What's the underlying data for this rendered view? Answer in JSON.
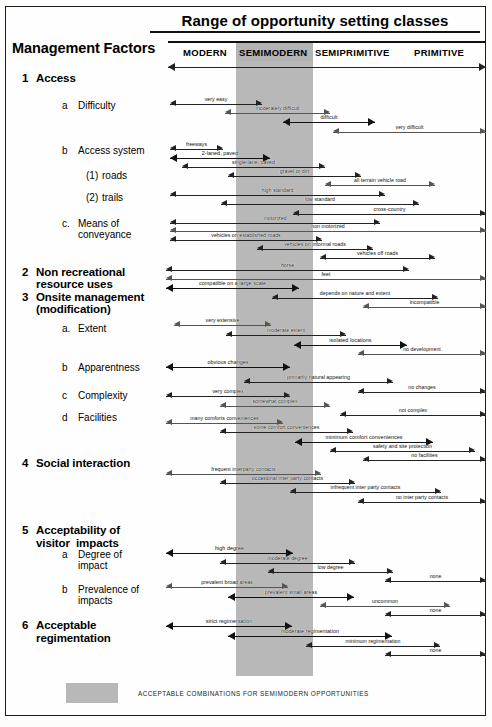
{
  "title": "Range of opportunity setting classes",
  "header": {
    "row_label": "Management Factors",
    "columns": [
      {
        "label": "MODERN",
        "x": 183,
        "shaded": false
      },
      {
        "label": "SEMIMODERN",
        "x": 239,
        "shaded": true
      },
      {
        "label": "SEMIPRIMITIVE",
        "x": 315,
        "shaded": false
      },
      {
        "label": "PRIMITIVE",
        "x": 414,
        "shaded": false
      }
    ]
  },
  "shaded_band": {
    "color": "#b8b8b8",
    "left": 236,
    "width": 77,
    "top": 43,
    "bottom": 676
  },
  "legend": {
    "swatch_color": "#b8b8b8",
    "text": "ACCEPTABLE COMBINATIONS FOR SEMIMODERN OPPORTUNITIES"
  },
  "factors": [
    {
      "num": "1",
      "label": "Access",
      "level": 1,
      "x": 22,
      "y": 72
    },
    {
      "num": "a",
      "label": "Difficulty",
      "level": 2,
      "x": 62,
      "y": 100
    },
    {
      "num": "b",
      "label": "Access system",
      "level": 2,
      "x": 62,
      "y": 145
    },
    {
      "num": "(1)",
      "label": "roads",
      "level": 3,
      "x": 86,
      "y": 170
    },
    {
      "num": "(2)",
      "label": "trails",
      "level": 3,
      "x": 86,
      "y": 192
    },
    {
      "num": "c.",
      "label": "Means of",
      "level": 2,
      "x": 62,
      "y": 218
    },
    {
      "num": "",
      "label": "conveyance",
      "level": 2,
      "x": 78,
      "y": 229
    },
    {
      "num": "2",
      "label": "Non recreational",
      "level": 1,
      "x": 22,
      "y": 266
    },
    {
      "num": "",
      "label": "resource uses",
      "level": 1,
      "x": 36,
      "y": 278
    },
    {
      "num": "3",
      "label": "Onsite management",
      "level": 1,
      "x": 22,
      "y": 291
    },
    {
      "num": "",
      "label": "(modification)",
      "level": 1,
      "x": 36,
      "y": 303
    },
    {
      "num": "a.",
      "label": "Extent",
      "level": 2,
      "x": 62,
      "y": 323
    },
    {
      "num": "b",
      "label": "Apparentness",
      "level": 2,
      "x": 62,
      "y": 362
    },
    {
      "num": "c",
      "label": "Complexity",
      "level": 2,
      "x": 62,
      "y": 390
    },
    {
      "num": "d",
      "label": "Facilities",
      "level": 2,
      "x": 62,
      "y": 412
    },
    {
      "num": "4",
      "label": "Social interaction",
      "level": 1,
      "x": 22,
      "y": 457
    },
    {
      "num": "5",
      "label": "Acceptability of",
      "level": 1,
      "x": 22,
      "y": 524
    },
    {
      "num": "",
      "label": "visitor  impacts",
      "level": 1,
      "x": 36,
      "y": 537
    },
    {
      "num": "a",
      "label": "Degree of",
      "level": 2,
      "x": 62,
      "y": 549
    },
    {
      "num": "",
      "label": "impact",
      "level": 2,
      "x": 78,
      "y": 560
    },
    {
      "num": "b",
      "label": "Prevalence of",
      "level": 2,
      "x": 62,
      "y": 584
    },
    {
      "num": "",
      "label": "impacts",
      "level": 2,
      "x": 78,
      "y": 595
    },
    {
      "num": "6",
      "label": "Acceptable",
      "level": 1,
      "x": 22,
      "y": 619
    },
    {
      "num": "",
      "label": "regimentation",
      "level": 1,
      "x": 36,
      "y": 632
    }
  ],
  "arrows": [
    {
      "label": "very easy",
      "x": 170,
      "w": 92,
      "y": 99,
      "weight": "normal"
    },
    {
      "label": "moderately difficult",
      "x": 225,
      "w": 105,
      "y": 108,
      "weight": "light"
    },
    {
      "label": "difficult",
      "x": 283,
      "w": 92,
      "y": 117,
      "weight": "bold"
    },
    {
      "label": "very difficult",
      "x": 333,
      "w": 153,
      "y": 127,
      "weight": "light"
    },
    {
      "label": "freeways",
      "x": 170,
      "w": 53,
      "y": 144,
      "weight": "normal"
    },
    {
      "label": "2-laned, paved",
      "x": 170,
      "w": 100,
      "y": 153,
      "weight": "bold"
    },
    {
      "label": "single-lane, paved",
      "x": 182,
      "w": 143,
      "y": 162,
      "weight": "normal"
    },
    {
      "label": "gravel or dirt",
      "x": 228,
      "w": 133,
      "y": 171,
      "weight": "normal"
    },
    {
      "label": "all terrain vehicle road",
      "x": 325,
      "w": 110,
      "y": 180,
      "weight": "light"
    },
    {
      "label": "high standard",
      "x": 170,
      "w": 215,
      "y": 190,
      "weight": "normal"
    },
    {
      "label": "low standard",
      "x": 221,
      "w": 198,
      "y": 199,
      "weight": "normal"
    },
    {
      "label": "cross-country",
      "x": 293,
      "w": 193,
      "y": 209,
      "weight": "normal"
    },
    {
      "label": "motorized",
      "x": 170,
      "w": 210,
      "y": 218,
      "weight": "normal"
    },
    {
      "label": "non motorized",
      "x": 170,
      "w": 316,
      "y": 226,
      "weight": "light"
    },
    {
      "label": "vehicles on established roads",
      "x": 170,
      "w": 152,
      "y": 235,
      "weight": "normal"
    },
    {
      "label": "vehicles on informal roads",
      "x": 257,
      "w": 116,
      "y": 244,
      "weight": "normal"
    },
    {
      "label": "vehicles  off roads",
      "x": 320,
      "w": 115,
      "y": 253,
      "weight": "normal"
    },
    {
      "label": "horse",
      "x": 166,
      "w": 243,
      "y": 265,
      "weight": "normal"
    },
    {
      "label": "feet",
      "x": 166,
      "w": 320,
      "y": 274,
      "weight": "light"
    },
    {
      "label": "compatible on a large scale",
      "x": 166,
      "w": 133,
      "y": 283,
      "weight": "bold"
    },
    {
      "label": "depends on nature and extent",
      "x": 272,
      "w": 166,
      "y": 293,
      "weight": "normal"
    },
    {
      "label": "incompatible",
      "x": 363,
      "w": 123,
      "y": 302,
      "weight": "light"
    },
    {
      "label": "very extensive",
      "x": 174,
      "w": 97,
      "y": 320,
      "weight": "light"
    },
    {
      "label": "moderate extent",
      "x": 226,
      "w": 120,
      "y": 330,
      "weight": "normal"
    },
    {
      "label": "isolated locations",
      "x": 294,
      "w": 113,
      "y": 340,
      "weight": "bold"
    },
    {
      "label": "no development",
      "x": 358,
      "w": 128,
      "y": 349,
      "weight": "light"
    },
    {
      "label": "obvious changes",
      "x": 166,
      "w": 124,
      "y": 362,
      "weight": "bold"
    },
    {
      "label": "primarily natural appearing",
      "x": 244,
      "w": 149,
      "y": 377,
      "weight": "normal"
    },
    {
      "label": "no changes",
      "x": 358,
      "w": 128,
      "y": 387,
      "weight": "normal"
    },
    {
      "label": "very complex",
      "x": 166,
      "w": 124,
      "y": 391,
      "weight": "normal"
    },
    {
      "label": "somewhat complex",
      "x": 220,
      "w": 110,
      "y": 401,
      "weight": "light"
    },
    {
      "label": "not complex",
      "x": 340,
      "w": 146,
      "y": 410,
      "weight": "normal"
    },
    {
      "label": "many comforts conveniences",
      "x": 166,
      "w": 117,
      "y": 418,
      "weight": "light"
    },
    {
      "label": "some comfort conveniences",
      "x": 220,
      "w": 133,
      "y": 427,
      "weight": "normal"
    },
    {
      "label": "minimum comfort conveniences",
      "x": 295,
      "w": 138,
      "y": 437,
      "weight": "bold"
    },
    {
      "label": "safety and site protection",
      "x": 330,
      "w": 145,
      "y": 446,
      "weight": "normal"
    },
    {
      "label": "no facilities",
      "x": 363,
      "w": 123,
      "y": 455,
      "weight": "normal"
    },
    {
      "label": "frequent interparty contacts",
      "x": 166,
      "w": 155,
      "y": 469,
      "weight": "light"
    },
    {
      "label": "occasional inter party contacts",
      "x": 220,
      "w": 135,
      "y": 478,
      "weight": "normal"
    },
    {
      "label": "infrequent inter party contacts",
      "x": 290,
      "w": 151,
      "y": 487,
      "weight": "normal"
    },
    {
      "label": "no inter party contacts",
      "x": 358,
      "w": 128,
      "y": 497,
      "weight": "normal"
    },
    {
      "label": "high degree",
      "x": 166,
      "w": 127,
      "y": 548,
      "weight": "bold"
    },
    {
      "label": "moderate degree",
      "x": 220,
      "w": 135,
      "y": 558,
      "weight": "normal"
    },
    {
      "label": "low degree",
      "x": 268,
      "w": 125,
      "y": 567,
      "weight": "normal"
    },
    {
      "label": "none",
      "x": 385,
      "w": 101,
      "y": 576,
      "weight": "normal"
    },
    {
      "label": "prevalent broad areas",
      "x": 166,
      "w": 122,
      "y": 582,
      "weight": "light"
    },
    {
      "label": "prevalent small areas",
      "x": 228,
      "w": 126,
      "y": 592,
      "weight": "bold"
    },
    {
      "label": "uncommon",
      "x": 320,
      "w": 130,
      "y": 601,
      "weight": "light"
    },
    {
      "label": "none",
      "x": 385,
      "w": 101,
      "y": 610,
      "weight": "normal"
    },
    {
      "label": "strict regimentation",
      "x": 166,
      "w": 126,
      "y": 621,
      "weight": "bold"
    },
    {
      "label": "moderate regimentation",
      "x": 228,
      "w": 164,
      "y": 631,
      "weight": "bold"
    },
    {
      "label": "minimum regimentation",
      "x": 306,
      "w": 134,
      "y": 641,
      "weight": "normal"
    },
    {
      "label": "none",
      "x": 385,
      "w": 101,
      "y": 650,
      "weight": "normal"
    }
  ]
}
